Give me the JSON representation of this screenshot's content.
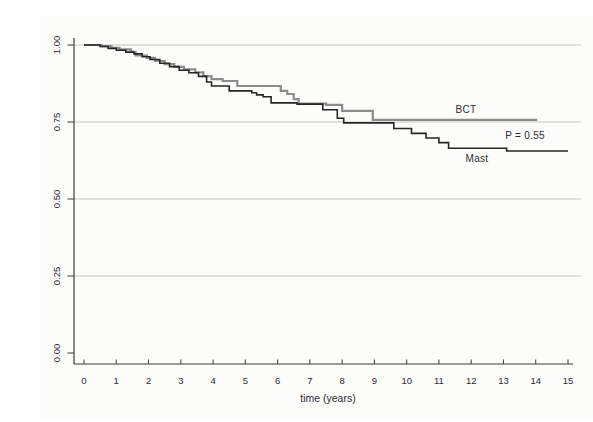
{
  "figure": {
    "background": "#fcfcfb"
  },
  "chart_data": {
    "type": "line",
    "subtype": "kaplan-meier-step-curves",
    "title": "",
    "xlabel": "time (years)",
    "ylabel": "",
    "xlim": [
      0,
      15
    ],
    "ylim": [
      0.0,
      1.0
    ],
    "x_ticks": [
      0,
      1,
      2,
      3,
      4,
      5,
      6,
      7,
      8,
      9,
      10,
      11,
      12,
      13,
      14,
      15
    ],
    "y_ticks": [
      {
        "v": 0.0,
        "label": "0.00"
      },
      {
        "v": 0.25,
        "label": "0.25"
      },
      {
        "v": 0.5,
        "label": "0.50"
      },
      {
        "v": 0.75,
        "label": "0.75"
      },
      {
        "v": 1.0,
        "label": "1.00"
      }
    ],
    "grid": "horizontal gridlines at 0.25, 0.50, 0.75, 1.00",
    "legend_position": "inline annotations near curve ends",
    "colors": {
      "grid": "#c6c6c6",
      "axis": "#3c3c3c",
      "text": "#2b2b2b"
    },
    "series": [
      {
        "name": "BCT",
        "color": "#8c8c8c",
        "stroke_width": 2.2,
        "points": [
          [
            0,
            1.0
          ],
          [
            0.55,
            0.996
          ],
          [
            0.85,
            0.991
          ],
          [
            1.1,
            0.986
          ],
          [
            1.45,
            0.978
          ],
          [
            1.6,
            0.966
          ],
          [
            1.95,
            0.958
          ],
          [
            2.2,
            0.948
          ],
          [
            2.5,
            0.938
          ],
          [
            2.8,
            0.929
          ],
          [
            3.1,
            0.921
          ],
          [
            3.45,
            0.911
          ],
          [
            3.7,
            0.899
          ],
          [
            3.95,
            0.889
          ],
          [
            4.3,
            0.883
          ],
          [
            4.75,
            0.867
          ],
          [
            6.1,
            0.851
          ],
          [
            6.3,
            0.841
          ],
          [
            6.5,
            0.824
          ],
          [
            6.65,
            0.81
          ],
          [
            7.5,
            0.806
          ],
          [
            8.0,
            0.786
          ],
          [
            8.95,
            0.757
          ],
          [
            14.05,
            0.757
          ]
        ]
      },
      {
        "name": "Mast",
        "color": "#262626",
        "stroke_width": 1.6,
        "points": [
          [
            0,
            1.0
          ],
          [
            0.5,
            0.995
          ],
          [
            0.75,
            0.989
          ],
          [
            1.0,
            0.983
          ],
          [
            1.3,
            0.977
          ],
          [
            1.55,
            0.971
          ],
          [
            1.8,
            0.962
          ],
          [
            2.05,
            0.953
          ],
          [
            2.35,
            0.941
          ],
          [
            2.65,
            0.93
          ],
          [
            2.95,
            0.918
          ],
          [
            3.25,
            0.91
          ],
          [
            3.55,
            0.898
          ],
          [
            3.8,
            0.88
          ],
          [
            3.95,
            0.867
          ],
          [
            4.5,
            0.851
          ],
          [
            5.2,
            0.845
          ],
          [
            5.35,
            0.838
          ],
          [
            5.55,
            0.832
          ],
          [
            5.8,
            0.812
          ],
          [
            6.6,
            0.808
          ],
          [
            7.4,
            0.79
          ],
          [
            7.85,
            0.762
          ],
          [
            8.05,
            0.747
          ],
          [
            9.6,
            0.729
          ],
          [
            10.15,
            0.713
          ],
          [
            10.6,
            0.698
          ],
          [
            11.0,
            0.683
          ],
          [
            11.3,
            0.665
          ],
          [
            13.1,
            0.656
          ],
          [
            15.0,
            0.656
          ]
        ]
      }
    ],
    "annotations": [
      {
        "name": "bct-label",
        "text": "BCT"
      },
      {
        "name": "p-value-label",
        "text": "P = 0.55"
      },
      {
        "name": "mast-label",
        "text": "Mast"
      }
    ]
  }
}
